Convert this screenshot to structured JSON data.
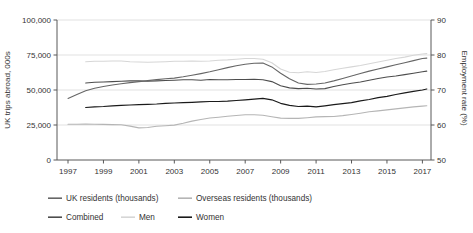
{
  "chart_data": {
    "type": "line",
    "title": "",
    "left_axis": {
      "label": "UK trips abroad, 000s",
      "tick_labels": [
        "0",
        "25,000",
        "50,000",
        "75,000",
        "100,000"
      ],
      "tick_values": [
        0,
        25000,
        50000,
        75000,
        100000
      ],
      "range": [
        0,
        100000
      ]
    },
    "right_axis": {
      "label": "Employment rate (%)",
      "tick_labels": [
        "50",
        "60",
        "70",
        "80",
        "90"
      ],
      "tick_values": [
        50,
        60,
        70,
        80,
        90
      ],
      "range": [
        50,
        90
      ]
    },
    "x_axis": {
      "tick_labels": [
        "1997",
        "1999",
        "2001",
        "2003",
        "2005",
        "2007",
        "2009",
        "2011",
        "2013",
        "2015",
        "2017"
      ],
      "tick_values": [
        1997,
        1999,
        2001,
        2003,
        2005,
        2007,
        2009,
        2011,
        2013,
        2015,
        2017
      ],
      "range": [
        1997,
        2017
      ]
    },
    "grid": "horizontal-only",
    "legend_position": "bottom",
    "series": [
      {
        "name": "UK residents (thousands)",
        "axis": "left",
        "color": "#666666",
        "width": 1.1,
        "points": [
          [
            1997,
            44000
          ],
          [
            1997.5,
            46800
          ],
          [
            1998,
            49500
          ],
          [
            1998.5,
            51200
          ],
          [
            1999,
            52500
          ],
          [
            1999.5,
            53600
          ],
          [
            2000,
            54500
          ],
          [
            2000.5,
            55300
          ],
          [
            2001,
            56000
          ],
          [
            2001.5,
            56700
          ],
          [
            2002,
            57400
          ],
          [
            2002.5,
            58000
          ],
          [
            2003,
            58500
          ],
          [
            2003.5,
            59400
          ],
          [
            2004,
            60500
          ],
          [
            2004.5,
            61700
          ],
          [
            2005,
            63000
          ],
          [
            2005.5,
            64500
          ],
          [
            2006,
            66000
          ],
          [
            2006.5,
            67300
          ],
          [
            2007,
            68400
          ],
          [
            2007.5,
            69100
          ],
          [
            2008,
            69300
          ],
          [
            2008.5,
            66500
          ],
          [
            2009,
            62000
          ],
          [
            2009.5,
            58000
          ],
          [
            2010,
            55000
          ],
          [
            2010.5,
            54000
          ],
          [
            2011,
            54300
          ],
          [
            2011.5,
            55000
          ],
          [
            2012,
            56500
          ],
          [
            2012.5,
            58200
          ],
          [
            2013,
            60000
          ],
          [
            2013.5,
            61800
          ],
          [
            2014,
            63500
          ],
          [
            2014.5,
            65000
          ],
          [
            2015,
            66500
          ],
          [
            2015.5,
            68000
          ],
          [
            2016,
            69500
          ],
          [
            2016.5,
            71000
          ],
          [
            2017,
            72500
          ],
          [
            2017.25,
            72800
          ]
        ]
      },
      {
        "name": "Overseas residents (thousands)",
        "axis": "left",
        "color": "#b5b5b5",
        "width": 1.1,
        "points": [
          [
            1997,
            25500
          ],
          [
            1997.5,
            25600
          ],
          [
            1998,
            25700
          ],
          [
            1998.5,
            25600
          ],
          [
            1999,
            25400
          ],
          [
            1999.5,
            25300
          ],
          [
            2000,
            25200
          ],
          [
            2000.5,
            24200
          ],
          [
            2001,
            22900
          ],
          [
            2001.5,
            23200
          ],
          [
            2002,
            24100
          ],
          [
            2002.5,
            24500
          ],
          [
            2003,
            24900
          ],
          [
            2003.5,
            26300
          ],
          [
            2004,
            27800
          ],
          [
            2004.5,
            28900
          ],
          [
            2005,
            30000
          ],
          [
            2005.5,
            30600
          ],
          [
            2006,
            31200
          ],
          [
            2006.5,
            31800
          ],
          [
            2007,
            32300
          ],
          [
            2007.5,
            32300
          ],
          [
            2008,
            32000
          ],
          [
            2008.5,
            30900
          ],
          [
            2009,
            29900
          ],
          [
            2009.5,
            29700
          ],
          [
            2010,
            29700
          ],
          [
            2010.5,
            30200
          ],
          [
            2011,
            30800
          ],
          [
            2011.5,
            31000
          ],
          [
            2012,
            31100
          ],
          [
            2012.5,
            31700
          ],
          [
            2013,
            32500
          ],
          [
            2013.5,
            33400
          ],
          [
            2014,
            34400
          ],
          [
            2014.5,
            35100
          ],
          [
            2015,
            35800
          ],
          [
            2015.5,
            36500
          ],
          [
            2016,
            37200
          ],
          [
            2016.5,
            37900
          ],
          [
            2017,
            38500
          ],
          [
            2017.25,
            38700
          ]
        ]
      },
      {
        "name": "Combined",
        "axis": "right",
        "color": "#4d4d4d",
        "width": 1.1,
        "points": [
          [
            1998,
            72.0
          ],
          [
            1998.5,
            72.2
          ],
          [
            1999,
            72.3
          ],
          [
            1999.5,
            72.4
          ],
          [
            2000,
            72.5
          ],
          [
            2000.5,
            72.6
          ],
          [
            2001,
            72.6
          ],
          [
            2001.5,
            72.5
          ],
          [
            2002,
            72.6
          ],
          [
            2002.5,
            72.7
          ],
          [
            2003,
            72.8
          ],
          [
            2003.5,
            72.9
          ],
          [
            2004,
            72.9
          ],
          [
            2004.5,
            72.8
          ],
          [
            2005,
            73.0
          ],
          [
            2005.5,
            72.9
          ],
          [
            2006,
            72.9
          ],
          [
            2006.5,
            73.0
          ],
          [
            2007,
            73.0
          ],
          [
            2007.5,
            73.1
          ],
          [
            2008,
            72.9
          ],
          [
            2008.5,
            72.4
          ],
          [
            2009,
            71.2
          ],
          [
            2009.5,
            70.6
          ],
          [
            2010,
            70.4
          ],
          [
            2010.5,
            70.5
          ],
          [
            2011,
            70.3
          ],
          [
            2011.5,
            70.4
          ],
          [
            2012,
            71.0
          ],
          [
            2012.5,
            71.5
          ],
          [
            2013,
            71.9
          ],
          [
            2013.5,
            72.3
          ],
          [
            2014,
            72.8
          ],
          [
            2014.5,
            73.3
          ],
          [
            2015,
            73.7
          ],
          [
            2015.5,
            74.0
          ],
          [
            2016,
            74.4
          ],
          [
            2016.5,
            74.8
          ],
          [
            2017,
            75.2
          ],
          [
            2017.25,
            75.4
          ]
        ]
      },
      {
        "name": "Men",
        "axis": "right",
        "color": "#d6d6d6",
        "width": 1.1,
        "points": [
          [
            1998,
            78.1
          ],
          [
            1998.5,
            78.2
          ],
          [
            1999,
            78.2
          ],
          [
            1999.5,
            78.3
          ],
          [
            2000,
            78.3
          ],
          [
            2000.5,
            78.1
          ],
          [
            2001,
            78.0
          ],
          [
            2001.5,
            77.9
          ],
          [
            2002,
            78.0
          ],
          [
            2002.5,
            78.1
          ],
          [
            2003,
            78.2
          ],
          [
            2003.5,
            78.2
          ],
          [
            2004,
            78.3
          ],
          [
            2004.5,
            78.2
          ],
          [
            2005,
            78.3
          ],
          [
            2005.5,
            78.5
          ],
          [
            2006,
            78.6
          ],
          [
            2006.5,
            78.8
          ],
          [
            2007,
            79.0
          ],
          [
            2007.5,
            79.0
          ],
          [
            2008,
            78.8
          ],
          [
            2008.5,
            77.8
          ],
          [
            2009,
            76.0
          ],
          [
            2009.5,
            75.1
          ],
          [
            2010,
            74.9
          ],
          [
            2010.5,
            75.2
          ],
          [
            2011,
            75.0
          ],
          [
            2011.5,
            75.3
          ],
          [
            2012,
            75.8
          ],
          [
            2012.5,
            76.2
          ],
          [
            2013,
            76.6
          ],
          [
            2013.5,
            77.0
          ],
          [
            2014,
            77.5
          ],
          [
            2014.5,
            78.0
          ],
          [
            2015,
            78.5
          ],
          [
            2015.5,
            79.0
          ],
          [
            2016,
            79.4
          ],
          [
            2016.5,
            79.9
          ],
          [
            2017,
            80.3
          ],
          [
            2017.25,
            80.4
          ]
        ]
      },
      {
        "name": "Women",
        "axis": "right",
        "color": "#1a1a1a",
        "width": 1.2,
        "points": [
          [
            1998,
            65.0
          ],
          [
            1998.5,
            65.2
          ],
          [
            1999,
            65.3
          ],
          [
            1999.5,
            65.5
          ],
          [
            2000,
            65.6
          ],
          [
            2000.5,
            65.7
          ],
          [
            2001,
            65.8
          ],
          [
            2001.5,
            65.9
          ],
          [
            2002,
            66.0
          ],
          [
            2002.5,
            66.2
          ],
          [
            2003,
            66.3
          ],
          [
            2003.5,
            66.4
          ],
          [
            2004,
            66.5
          ],
          [
            2004.5,
            66.6
          ],
          [
            2005,
            66.7
          ],
          [
            2005.5,
            66.7
          ],
          [
            2006,
            66.8
          ],
          [
            2006.5,
            67.0
          ],
          [
            2007,
            67.2
          ],
          [
            2007.5,
            67.4
          ],
          [
            2008,
            67.6
          ],
          [
            2008.5,
            67.2
          ],
          [
            2009,
            66.2
          ],
          [
            2009.5,
            65.6
          ],
          [
            2010,
            65.3
          ],
          [
            2010.5,
            65.4
          ],
          [
            2011,
            65.2
          ],
          [
            2011.5,
            65.5
          ],
          [
            2012,
            65.8
          ],
          [
            2012.5,
            66.1
          ],
          [
            2013,
            66.4
          ],
          [
            2013.5,
            66.9
          ],
          [
            2014,
            67.3
          ],
          [
            2014.5,
            67.8
          ],
          [
            2015,
            68.2
          ],
          [
            2015.5,
            68.7
          ],
          [
            2016,
            69.2
          ],
          [
            2016.5,
            69.6
          ],
          [
            2017,
            70.0
          ],
          [
            2017.25,
            70.3
          ]
        ]
      }
    ],
    "legend": {
      "swatch_width": 14,
      "rows": [
        {
          "y": 201,
          "items": [
            {
              "series": 0,
              "swatch_x": 48,
              "label_x": 66
            },
            {
              "series": 1,
              "swatch_x": 178,
              "label_x": 196
            }
          ]
        },
        {
          "y": 220,
          "items": [
            {
              "series": 2,
              "swatch_x": 48,
              "label_x": 66
            },
            {
              "series": 3,
              "swatch_x": 121,
              "label_x": 139
            },
            {
              "series": 4,
              "swatch_x": 178,
              "label_x": 196
            }
          ]
        }
      ]
    },
    "style": {
      "grid_color": "#d9d9d9",
      "axis_color": "#595959",
      "text_color": "#333333",
      "background": "#ffffff"
    }
  }
}
